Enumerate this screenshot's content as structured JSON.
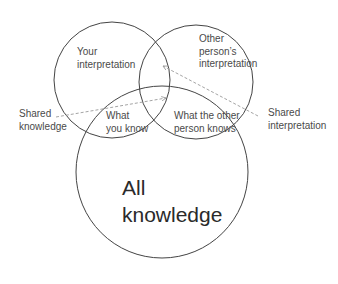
{
  "diagram": {
    "type": "venn",
    "colors": {
      "circle_stroke": "#444444",
      "arrow": "#9a9a9a",
      "text": "#4a4a4a"
    },
    "circles": [
      {
        "id": "your-interpretation",
        "label_lines": [
          "Your",
          "interpretation"
        ],
        "cx": 112,
        "cy": 80,
        "r": 58
      },
      {
        "id": "other-interpretation",
        "label_lines": [
          "Other",
          "person’s",
          "interpretation"
        ],
        "cx": 196,
        "cy": 82,
        "r": 57
      },
      {
        "id": "all-knowledge",
        "label_lines": [
          "All",
          "knowledge"
        ],
        "cx": 162,
        "cy": 172,
        "r": 86
      }
    ],
    "regions": {
      "what_you_know": [
        "What",
        "you know"
      ],
      "what_other_knows": [
        "What the other",
        "person knows"
      ]
    },
    "callouts": {
      "shared_knowledge": [
        "Shared",
        "knowledge"
      ],
      "shared_interpretation": [
        "Shared",
        "interpretation"
      ]
    }
  }
}
